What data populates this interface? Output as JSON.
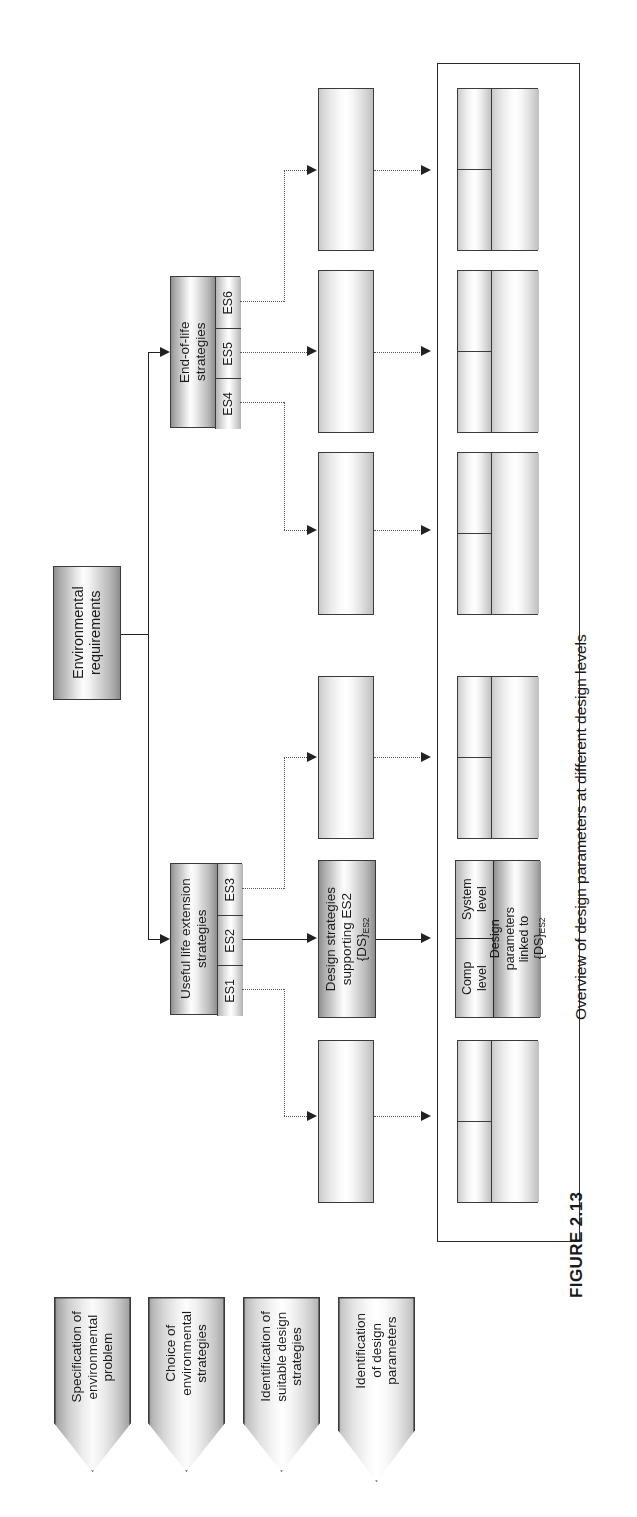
{
  "figure": {
    "caption": "FIGURE 2.13",
    "overview_label": "Overview of design parameters at different design levels"
  },
  "phases": [
    {
      "id": "phase-1",
      "label": "Specification of\nenvironmental\nproblem"
    },
    {
      "id": "phase-2",
      "label": "Choice of\nenvironmental\nstrategies"
    },
    {
      "id": "phase-3",
      "label": "Identification of\nsuitable design\nstrategies"
    },
    {
      "id": "phase-4",
      "label": "Identification\nof design\nparameters"
    }
  ],
  "root": {
    "label": "Environmental\nrequirements"
  },
  "strategy_groups": [
    {
      "id": "useful-life-extension",
      "label": "Useful life extension\nstrategies",
      "items": [
        "ES1",
        "ES2",
        "ES3"
      ]
    },
    {
      "id": "end-of-life",
      "label": "End-of-life\nstrategies",
      "items": [
        "ES4",
        "ES5",
        "ES6"
      ]
    }
  ],
  "design_strategies": {
    "labelled": {
      "line1": "Design strategies",
      "line2": "supporting ES2",
      "line3_main": "{DS}",
      "line3_sub": "ES2"
    },
    "unlabelled_count": 5
  },
  "design_parameters": {
    "labelled": {
      "line1": "Design",
      "line2": "parameters",
      "line3": "linked to",
      "line4_main": "{DS}",
      "line4_sub": "ES2",
      "level_headers": [
        {
          "id": "system-level",
          "label": "System\nlevel"
        },
        {
          "id": "comp-level",
          "label": "Comp\nlevel"
        }
      ]
    },
    "unlabelled_count": 5
  },
  "colors": {
    "outline": "#2b2b2b",
    "box_border": "#3a3a3a",
    "connector": "#222222",
    "dashed_connector": "#555555",
    "page_background": "#ffffff"
  }
}
